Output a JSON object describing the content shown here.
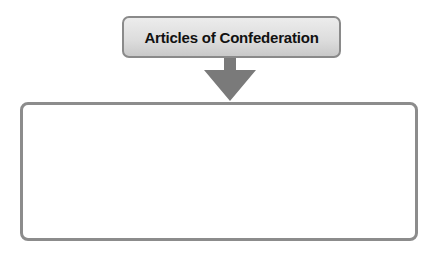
{
  "diagram": {
    "title": "Articles of Confederation",
    "arrow_direction": "down",
    "content_box_text": "",
    "colors": {
      "border": "#8a8a8a",
      "title_fill": "#dcdcdc",
      "arrow": "#7a7a7a"
    }
  }
}
